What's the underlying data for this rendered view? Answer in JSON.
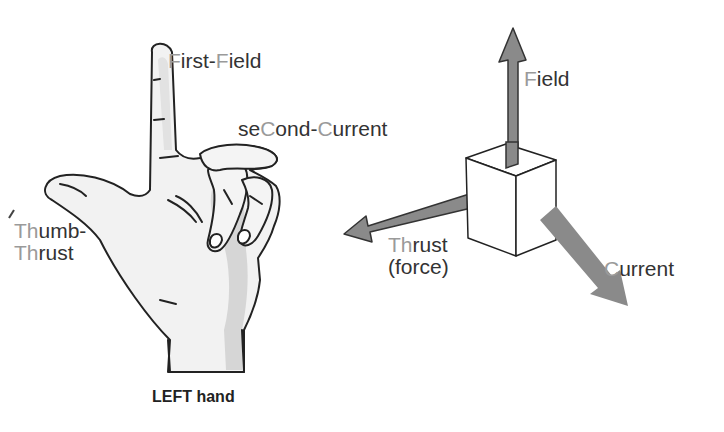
{
  "hand": {
    "caption": "LEFT hand",
    "labels": {
      "first_field": {
        "hl1": "F",
        "t1": "irst-",
        "hl2": "F",
        "t2": "ield"
      },
      "second_current": {
        "t1": "se",
        "hl1": "C",
        "t2": "ond-",
        "hl2": "C",
        "t3": "urrent"
      },
      "thumb_thrust": {
        "line1_hl": "Th",
        "line1": "umb-",
        "line2_hl": "Th",
        "line2": "rust"
      }
    }
  },
  "vectors": {
    "field": {
      "hl": "F",
      "text": "ield"
    },
    "thrust": {
      "hl": "Th",
      "text": "rust",
      "line2": "(force)"
    },
    "current": {
      "hl": "C",
      "text": "urrent"
    }
  },
  "colors": {
    "arrow_fill": "#8a8a8a",
    "arrow_stroke": "#333333",
    "label_text": "#333333",
    "highlight_letter": "#9a9a9a",
    "hand_fill": "#f2f2f2",
    "hand_shadow": "#d6d6d6"
  }
}
